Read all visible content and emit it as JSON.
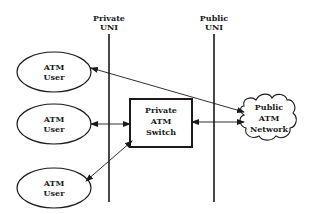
{
  "diagram": {
    "interfaces": {
      "private": {
        "line1": "Private",
        "line2": "UNI"
      },
      "public": {
        "line1": "Public",
        "line2": "UNI"
      }
    },
    "users": [
      {
        "line1": "ATM",
        "line2": "User"
      },
      {
        "line1": "ATM",
        "line2": "User"
      },
      {
        "line1": "ATM",
        "line2": "User"
      }
    ],
    "switch": {
      "line1": "Private",
      "line2": "ATM",
      "line3": "Switch"
    },
    "network": {
      "line1": "Public",
      "line2": "ATM",
      "line3": "Network"
    },
    "connections": [
      {
        "from": "user-1",
        "to": "public-atm-network",
        "type": "bidirectional"
      },
      {
        "from": "user-2",
        "to": "private-atm-switch",
        "type": "bidirectional"
      },
      {
        "from": "user-3",
        "to": "private-atm-switch",
        "type": "bidirectional"
      },
      {
        "from": "private-atm-switch",
        "to": "public-atm-network",
        "type": "bidirectional"
      }
    ],
    "stroke_color": "#1a1a1a"
  }
}
